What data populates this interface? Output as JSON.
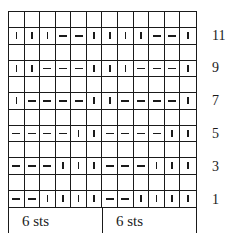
{
  "chart": {
    "columns": 12,
    "rows_total": 12,
    "legend_symbols": {
      "|": "knit (vertical bar)",
      "-": "purl (horizontal dash)",
      "": "empty cell"
    },
    "grid_rows_top_to_bottom": [
      {
        "row": 12,
        "label": "",
        "cells": [
          "",
          "",
          "",
          "",
          "",
          "",
          "",
          "",
          "",
          "",
          "",
          ""
        ]
      },
      {
        "row": 11,
        "label": "11",
        "cells": [
          "|",
          "|",
          "|",
          "-",
          "-",
          "|",
          "|",
          "|",
          "|",
          "-",
          "-",
          "|"
        ]
      },
      {
        "row": 10,
        "label": "",
        "cells": [
          "",
          "",
          "",
          "",
          "",
          "",
          "",
          "",
          "",
          "",
          "",
          ""
        ]
      },
      {
        "row": 9,
        "label": "9",
        "cells": [
          "|",
          "|",
          "-",
          "-",
          "-",
          "|",
          "|",
          "|",
          "-",
          "-",
          "-",
          "|"
        ]
      },
      {
        "row": 8,
        "label": "",
        "cells": [
          "",
          "",
          "",
          "",
          "",
          "",
          "",
          "",
          "",
          "",
          "",
          ""
        ]
      },
      {
        "row": 7,
        "label": "7",
        "cells": [
          "|",
          "-",
          "-",
          "-",
          "-",
          "|",
          "|",
          "-",
          "-",
          "-",
          "-",
          "|"
        ]
      },
      {
        "row": 6,
        "label": "",
        "cells": [
          "",
          "",
          "",
          "",
          "",
          "",
          "",
          "",
          "",
          "",
          "",
          ""
        ]
      },
      {
        "row": 5,
        "label": "5",
        "cells": [
          "-",
          "-",
          "-",
          "-",
          "|",
          "|",
          "-",
          "-",
          "-",
          "-",
          "|",
          "|"
        ]
      },
      {
        "row": 4,
        "label": "",
        "cells": [
          "",
          "",
          "",
          "",
          "",
          "",
          "",
          "",
          "",
          "",
          "",
          ""
        ]
      },
      {
        "row": 3,
        "label": "3",
        "cells": [
          "-",
          "-",
          "-",
          "|",
          "|",
          "|",
          "-",
          "-",
          "-",
          "|",
          "|",
          "|"
        ]
      },
      {
        "row": 2,
        "label": "",
        "cells": [
          "",
          "",
          "",
          "",
          "",
          "",
          "",
          "",
          "",
          "",
          "",
          ""
        ]
      },
      {
        "row": 1,
        "label": "1",
        "cells": [
          "-",
          "-",
          "|",
          "|",
          "|",
          "|",
          "-",
          "-",
          "|",
          "|",
          "|",
          "|"
        ]
      }
    ],
    "repeat_labels": [
      "6 sts",
      "6 sts"
    ]
  }
}
